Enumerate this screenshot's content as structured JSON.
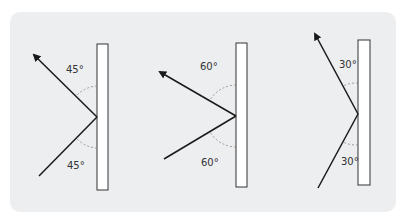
{
  "diagrams": [
    {
      "name": "reflection-45",
      "incident_label": "45°",
      "reflected_label": "45°"
    },
    {
      "name": "reflection-60",
      "incident_label": "60°",
      "reflected_label": "60°"
    },
    {
      "name": "reflection-30",
      "incident_label": "30°",
      "reflected_label": "30°"
    }
  ],
  "colors": {
    "background": "#eceef0",
    "line": "#1a1a1a",
    "mirror_fill": "#ffffff",
    "dashed_arc": "#888888"
  }
}
